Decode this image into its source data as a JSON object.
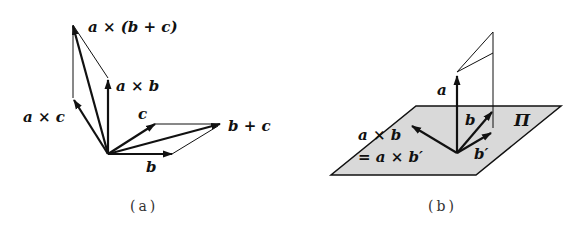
{
  "panel_a": {
    "caption": "(a)",
    "labels": {
      "a_cross_b_plus_c": "a × (b + c)",
      "a_cross_b": "a × b",
      "a_cross_c": "a × c",
      "c": "c",
      "b_plus_c": "b + c",
      "b": "b"
    }
  },
  "panel_b": {
    "caption": "(b)",
    "labels": {
      "a": "a",
      "b": "b",
      "b_prime": "b′",
      "plane": "Π",
      "a_cross_b": "a × b",
      "eq_a_cross_b_prime": "= a × b′"
    }
  },
  "colors": {
    "ink": "#111111",
    "plane_fill": "#d9d9d9",
    "background": "#ffffff"
  }
}
